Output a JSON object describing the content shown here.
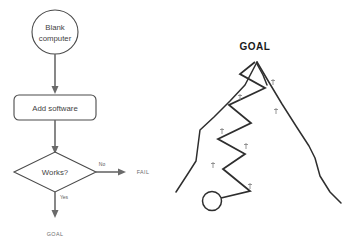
{
  "diagram": {
    "background_color": "#ffffff",
    "line_color": "#2e2e2e",
    "connector_color": "#6a6a6a"
  },
  "flowchart": {
    "start_node": {
      "shape": "circle",
      "line1": "Blank",
      "line2": "computer"
    },
    "process_node": {
      "shape": "rounded-rectangle",
      "label": "Add software"
    },
    "decision_node": {
      "shape": "diamond",
      "label": "Works?"
    },
    "branches": [
      {
        "label": "No",
        "outcome": "FAIL"
      },
      {
        "label": "Yes",
        "outcome": "GOAL"
      }
    ],
    "fail_label": "FAIL",
    "goal_label": "GOAL"
  },
  "mountain": {
    "peak_label": "GOAL",
    "start_marker": "climber-start-circle",
    "trail_markers": 6,
    "trail_marker_icon": "footprint-marker"
  }
}
